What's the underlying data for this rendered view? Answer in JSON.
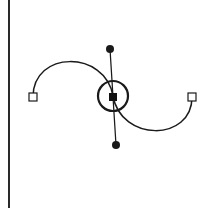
{
  "diagram": {
    "title": "Bezier curve smooth anchor point with control handles",
    "colors": {
      "background": "#ffffff",
      "stroke": "#1a1a1a",
      "border": "#2a2a2a",
      "anchor_fill": "#ffffff",
      "selected_fill": "#111111"
    },
    "left_border": {
      "x": 9,
      "y1": 0,
      "y2": 208
    },
    "curve": {
      "segments": [
        {
          "from": [
            33,
            97
          ],
          "c1": [
            33,
            50
          ],
          "c2": [
            105,
            50
          ],
          "to": [
            113,
            96
          ]
        },
        {
          "from": [
            113,
            96
          ],
          "c1": [
            121,
            142
          ],
          "c2": [
            192,
            142
          ],
          "to": [
            192,
            97
          ]
        }
      ]
    },
    "anchors": [
      {
        "id": "left-anchor",
        "x": 33,
        "y": 97,
        "size": 8,
        "type": "endpoint"
      },
      {
        "id": "center-anchor",
        "x": 113,
        "y": 97,
        "size": 8,
        "type": "selected"
      },
      {
        "id": "right-anchor",
        "x": 192,
        "y": 97,
        "size": 8,
        "type": "endpoint"
      }
    ],
    "handles": [
      {
        "id": "top-handle",
        "x": 110,
        "y": 49,
        "r": 4
      },
      {
        "id": "bottom-handle",
        "x": 116,
        "y": 145,
        "r": 4
      }
    ],
    "selection_ring": {
      "cx": 113,
      "cy": 96,
      "r": 15
    }
  }
}
